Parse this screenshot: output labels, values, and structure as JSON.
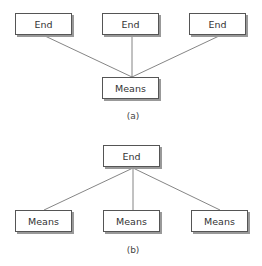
{
  "diagram_a": {
    "caption": "(a)",
    "ends": [
      "End",
      "End",
      "End"
    ],
    "means": "Means"
  },
  "diagram_b": {
    "caption": "(b)",
    "end": "End",
    "means": [
      "Means",
      "Means",
      "Means"
    ]
  }
}
